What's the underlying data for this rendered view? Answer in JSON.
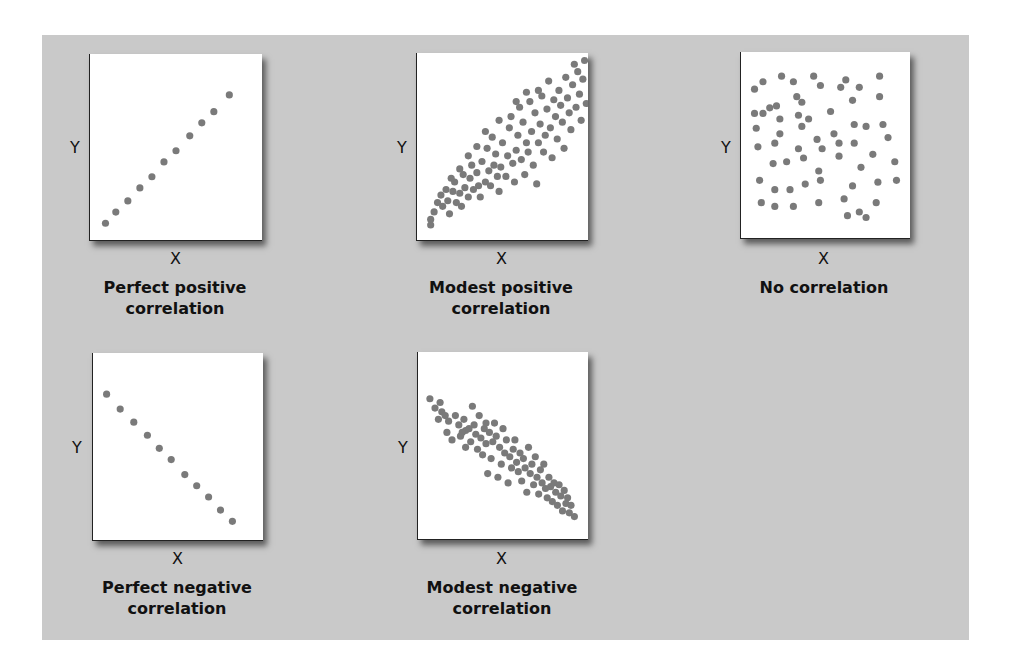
{
  "figure": {
    "background_color": "#c9c9c9",
    "dot_color": "#7a7a7a",
    "panels": [
      {
        "id": "perfect-positive",
        "caption_line1": "Perfect positive",
        "caption_line2": "correlation",
        "x_label": "X",
        "y_label": "Y"
      },
      {
        "id": "modest-positive",
        "caption_line1": "Modest positive",
        "caption_line2": "correlation",
        "x_label": "X",
        "y_label": "Y"
      },
      {
        "id": "no-correlation",
        "caption_line1": "No correlation",
        "caption_line2": "",
        "x_label": "X",
        "y_label": "Y"
      },
      {
        "id": "perfect-negative",
        "caption_line1": "Perfect negative",
        "caption_line2": "correlation",
        "x_label": "X",
        "y_label": "Y"
      },
      {
        "id": "modest-negative",
        "caption_line1": "Modest negative",
        "caption_line2": "correlation",
        "x_label": "X",
        "y_label": "Y"
      }
    ]
  },
  "chart_data": [
    {
      "type": "scatter",
      "title": "Perfect positive correlation",
      "xlabel": "X",
      "ylabel": "Y",
      "xlim": [
        0,
        1
      ],
      "ylim": [
        0,
        1
      ],
      "grid": false,
      "points": [
        [
          0.09,
          0.09
        ],
        [
          0.15,
          0.15
        ],
        [
          0.22,
          0.21
        ],
        [
          0.29,
          0.28
        ],
        [
          0.36,
          0.34
        ],
        [
          0.43,
          0.42
        ],
        [
          0.5,
          0.48
        ],
        [
          0.58,
          0.56
        ],
        [
          0.65,
          0.63
        ],
        [
          0.72,
          0.69
        ],
        [
          0.81,
          0.78
        ]
      ]
    },
    {
      "type": "scatter",
      "title": "Modest positive correlation",
      "xlabel": "X",
      "ylabel": "Y",
      "xlim": [
        0,
        1
      ],
      "ylim": [
        0,
        1
      ],
      "grid": false,
      "points": [
        [
          0.08,
          0.08
        ],
        [
          0.08,
          0.11
        ],
        [
          0.1,
          0.15
        ],
        [
          0.12,
          0.2
        ],
        [
          0.14,
          0.24
        ],
        [
          0.15,
          0.18
        ],
        [
          0.17,
          0.27
        ],
        [
          0.18,
          0.21
        ],
        [
          0.19,
          0.14
        ],
        [
          0.21,
          0.26
        ],
        [
          0.22,
          0.31
        ],
        [
          0.23,
          0.2
        ],
        [
          0.25,
          0.25
        ],
        [
          0.26,
          0.18
        ],
        [
          0.27,
          0.35
        ],
        [
          0.28,
          0.28
        ],
        [
          0.3,
          0.23
        ],
        [
          0.31,
          0.33
        ],
        [
          0.32,
          0.4
        ],
        [
          0.33,
          0.27
        ],
        [
          0.35,
          0.36
        ],
        [
          0.36,
          0.29
        ],
        [
          0.37,
          0.23
        ],
        [
          0.38,
          0.42
        ],
        [
          0.4,
          0.31
        ],
        [
          0.41,
          0.49
        ],
        [
          0.42,
          0.37
        ],
        [
          0.43,
          0.29
        ],
        [
          0.44,
          0.55
        ],
        [
          0.45,
          0.4
        ],
        [
          0.46,
          0.46
        ],
        [
          0.47,
          0.34
        ],
        [
          0.48,
          0.26
        ],
        [
          0.49,
          0.39
        ],
        [
          0.5,
          0.52
        ],
        [
          0.52,
          0.34
        ],
        [
          0.53,
          0.45
        ],
        [
          0.54,
          0.6
        ],
        [
          0.55,
          0.66
        ],
        [
          0.56,
          0.41
        ],
        [
          0.57,
          0.31
        ],
        [
          0.58,
          0.48
        ],
        [
          0.59,
          0.56
        ],
        [
          0.6,
          0.71
        ],
        [
          0.61,
          0.43
        ],
        [
          0.62,
          0.63
        ],
        [
          0.63,
          0.35
        ],
        [
          0.64,
          0.52
        ],
        [
          0.65,
          0.47
        ],
        [
          0.66,
          0.74
        ],
        [
          0.67,
          0.58
        ],
        [
          0.68,
          0.4
        ],
        [
          0.69,
          0.68
        ],
        [
          0.7,
          0.3
        ],
        [
          0.71,
          0.52
        ],
        [
          0.72,
          0.62
        ],
        [
          0.73,
          0.77
        ],
        [
          0.74,
          0.47
        ],
        [
          0.75,
          0.56
        ],
        [
          0.76,
          0.7
        ],
        [
          0.77,
          0.85
        ],
        [
          0.78,
          0.6
        ],
        [
          0.79,
          0.44
        ],
        [
          0.8,
          0.75
        ],
        [
          0.81,
          0.66
        ],
        [
          0.82,
          0.54
        ],
        [
          0.83,
          0.8
        ],
        [
          0.84,
          0.72
        ],
        [
          0.85,
          0.63
        ],
        [
          0.86,
          0.49
        ],
        [
          0.87,
          0.87
        ],
        [
          0.88,
          0.76
        ],
        [
          0.89,
          0.68
        ],
        [
          0.9,
          0.59
        ],
        [
          0.91,
          0.83
        ],
        [
          0.92,
          0.94
        ],
        [
          0.93,
          0.71
        ],
        [
          0.94,
          0.9
        ],
        [
          0.95,
          0.78
        ],
        [
          0.96,
          0.64
        ],
        [
          0.97,
          0.86
        ],
        [
          0.98,
          0.96
        ],
        [
          0.99,
          0.73
        ],
        [
          0.35,
          0.5
        ],
        [
          0.3,
          0.45
        ],
        [
          0.4,
          0.58
        ],
        [
          0.48,
          0.64
        ],
        [
          0.58,
          0.74
        ],
        [
          0.64,
          0.79
        ],
        [
          0.71,
          0.8
        ],
        [
          0.25,
          0.38
        ],
        [
          0.2,
          0.33
        ]
      ]
    },
    {
      "type": "scatter",
      "title": "No correlation",
      "xlabel": "X",
      "ylabel": "Y",
      "xlim": [
        0,
        1
      ],
      "ylim": [
        0,
        1
      ],
      "grid": false,
      "points": [
        [
          0.08,
          0.8
        ],
        [
          0.13,
          0.84
        ],
        [
          0.24,
          0.87
        ],
        [
          0.31,
          0.84
        ],
        [
          0.43,
          0.87
        ],
        [
          0.47,
          0.82
        ],
        [
          0.62,
          0.85
        ],
        [
          0.59,
          0.81
        ],
        [
          0.7,
          0.81
        ],
        [
          0.82,
          0.87
        ],
        [
          0.66,
          0.74
        ],
        [
          0.82,
          0.76
        ],
        [
          0.33,
          0.76
        ],
        [
          0.36,
          0.73
        ],
        [
          0.21,
          0.71
        ],
        [
          0.17,
          0.7
        ],
        [
          0.13,
          0.67
        ],
        [
          0.08,
          0.67
        ],
        [
          0.23,
          0.64
        ],
        [
          0.34,
          0.66
        ],
        [
          0.4,
          0.64
        ],
        [
          0.53,
          0.68
        ],
        [
          0.67,
          0.61
        ],
        [
          0.74,
          0.6
        ],
        [
          0.84,
          0.61
        ],
        [
          0.87,
          0.54
        ],
        [
          0.09,
          0.59
        ],
        [
          0.23,
          0.56
        ],
        [
          0.36,
          0.6
        ],
        [
          0.45,
          0.53
        ],
        [
          0.55,
          0.56
        ],
        [
          0.67,
          0.51
        ],
        [
          0.1,
          0.49
        ],
        [
          0.2,
          0.51
        ],
        [
          0.34,
          0.48
        ],
        [
          0.37,
          0.43
        ],
        [
          0.48,
          0.48
        ],
        [
          0.58,
          0.44
        ],
        [
          0.58,
          0.51
        ],
        [
          0.78,
          0.45
        ],
        [
          0.91,
          0.41
        ],
        [
          0.19,
          0.4
        ],
        [
          0.27,
          0.41
        ],
        [
          0.46,
          0.36
        ],
        [
          0.71,
          0.38
        ],
        [
          0.11,
          0.31
        ],
        [
          0.2,
          0.26
        ],
        [
          0.29,
          0.26
        ],
        [
          0.38,
          0.29
        ],
        [
          0.47,
          0.31
        ],
        [
          0.66,
          0.28
        ],
        [
          0.81,
          0.3
        ],
        [
          0.92,
          0.31
        ],
        [
          0.12,
          0.19
        ],
        [
          0.2,
          0.17
        ],
        [
          0.31,
          0.17
        ],
        [
          0.46,
          0.19
        ],
        [
          0.61,
          0.21
        ],
        [
          0.8,
          0.19
        ],
        [
          0.63,
          0.12
        ],
        [
          0.7,
          0.14
        ],
        [
          0.74,
          0.11
        ]
      ]
    },
    {
      "type": "scatter",
      "title": "Perfect negative correlation",
      "xlabel": "X",
      "ylabel": "Y",
      "xlim": [
        0,
        1
      ],
      "ylim": [
        0,
        1
      ],
      "grid": false,
      "points": [
        [
          0.08,
          0.78
        ],
        [
          0.16,
          0.7
        ],
        [
          0.24,
          0.63
        ],
        [
          0.32,
          0.56
        ],
        [
          0.39,
          0.49
        ],
        [
          0.46,
          0.43
        ],
        [
          0.54,
          0.35
        ],
        [
          0.61,
          0.29
        ],
        [
          0.68,
          0.23
        ],
        [
          0.75,
          0.16
        ],
        [
          0.82,
          0.1
        ]
      ]
    },
    {
      "type": "scatter",
      "title": "Modest negative correlation",
      "xlabel": "X",
      "ylabel": "Y",
      "xlim": [
        0,
        1
      ],
      "ylim": [
        0,
        1
      ],
      "grid": false,
      "points": [
        [
          0.07,
          0.75
        ],
        [
          0.1,
          0.7
        ],
        [
          0.13,
          0.73
        ],
        [
          0.14,
          0.68
        ],
        [
          0.16,
          0.66
        ],
        [
          0.18,
          0.63
        ],
        [
          0.17,
          0.57
        ],
        [
          0.2,
          0.53
        ],
        [
          0.22,
          0.66
        ],
        [
          0.24,
          0.61
        ],
        [
          0.25,
          0.55
        ],
        [
          0.27,
          0.64
        ],
        [
          0.28,
          0.58
        ],
        [
          0.28,
          0.49
        ],
        [
          0.3,
          0.59
        ],
        [
          0.31,
          0.52
        ],
        [
          0.32,
          0.71
        ],
        [
          0.33,
          0.61
        ],
        [
          0.34,
          0.56
        ],
        [
          0.35,
          0.48
        ],
        [
          0.36,
          0.66
        ],
        [
          0.37,
          0.54
        ],
        [
          0.38,
          0.45
        ],
        [
          0.39,
          0.59
        ],
        [
          0.4,
          0.51
        ],
        [
          0.41,
          0.35
        ],
        [
          0.42,
          0.57
        ],
        [
          0.43,
          0.43
        ],
        [
          0.44,
          0.52
        ],
        [
          0.45,
          0.62
        ],
        [
          0.46,
          0.55
        ],
        [
          0.47,
          0.33
        ],
        [
          0.48,
          0.49
        ],
        [
          0.49,
          0.4
        ],
        [
          0.5,
          0.59
        ],
        [
          0.51,
          0.46
        ],
        [
          0.52,
          0.53
        ],
        [
          0.53,
          0.3
        ],
        [
          0.54,
          0.44
        ],
        [
          0.55,
          0.38
        ],
        [
          0.56,
          0.48
        ],
        [
          0.57,
          0.53
        ],
        [
          0.58,
          0.41
        ],
        [
          0.59,
          0.36
        ],
        [
          0.6,
          0.46
        ],
        [
          0.61,
          0.31
        ],
        [
          0.62,
          0.43
        ],
        [
          0.63,
          0.38
        ],
        [
          0.64,
          0.25
        ],
        [
          0.65,
          0.49
        ],
        [
          0.66,
          0.35
        ],
        [
          0.67,
          0.4
        ],
        [
          0.68,
          0.29
        ],
        [
          0.69,
          0.44
        ],
        [
          0.7,
          0.33
        ],
        [
          0.71,
          0.24
        ],
        [
          0.72,
          0.37
        ],
        [
          0.73,
          0.3
        ],
        [
          0.74,
          0.4
        ],
        [
          0.75,
          0.27
        ],
        [
          0.76,
          0.22
        ],
        [
          0.77,
          0.33
        ],
        [
          0.78,
          0.28
        ],
        [
          0.79,
          0.2
        ],
        [
          0.8,
          0.3
        ],
        [
          0.81,
          0.25
        ],
        [
          0.82,
          0.18
        ],
        [
          0.83,
          0.29
        ],
        [
          0.84,
          0.23
        ],
        [
          0.85,
          0.15
        ],
        [
          0.86,
          0.26
        ],
        [
          0.87,
          0.19
        ],
        [
          0.88,
          0.22
        ],
        [
          0.89,
          0.14
        ],
        [
          0.9,
          0.18
        ],
        [
          0.92,
          0.12
        ],
        [
          0.4,
          0.62
        ],
        [
          0.26,
          0.57
        ],
        [
          0.12,
          0.64
        ]
      ]
    }
  ]
}
